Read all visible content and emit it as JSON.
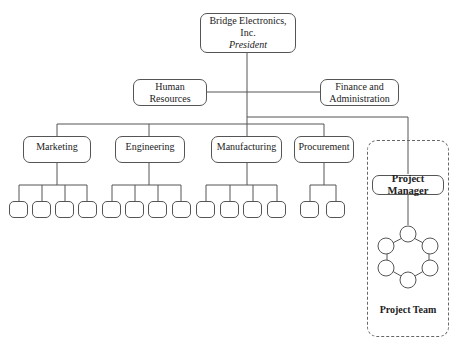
{
  "diagram": {
    "type": "org-chart",
    "root": {
      "line1": "Bridge Electronics,",
      "line2": "Inc.",
      "role": "President"
    },
    "staff": [
      {
        "line1": "Human",
        "line2": "Resources"
      },
      {
        "line1": "Finance and",
        "line2": "Administration"
      }
    ],
    "departments": [
      {
        "label": "Marketing",
        "sub_units": 4
      },
      {
        "label": "Engineering",
        "sub_units": 4
      },
      {
        "label": "Manufacturing",
        "sub_units": 4
      },
      {
        "label": "Procurement",
        "sub_units": 2
      }
    ],
    "project": {
      "manager_label": "Project Manager",
      "team_label": "Project Team",
      "team_members": 6
    },
    "colors": {
      "line": "#555555",
      "dashed_border": "#666666",
      "background": "#ffffff"
    }
  }
}
